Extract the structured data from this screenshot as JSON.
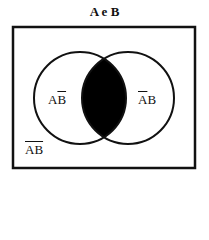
{
  "title": "A e B",
  "regions": {
    "a_only": {
      "a": "A",
      "b": "B",
      "overlined": "B"
    },
    "b_only": {
      "a": "A",
      "b": "B",
      "overlined": "A"
    },
    "neither": {
      "text": "AB",
      "overlined": "AB"
    },
    "intersection": {
      "shaded": true,
      "color": "#000000"
    }
  }
}
